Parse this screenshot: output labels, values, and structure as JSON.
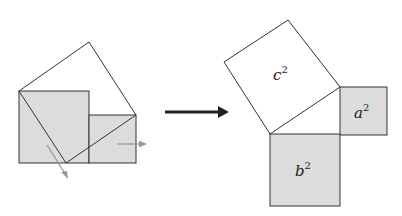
{
  "diagram": {
    "type": "pythagorean-proof-rearrangement",
    "colors": {
      "shaded_fill": "#dcdcdc",
      "outline": "#333333",
      "motion_arrow": "#999999",
      "main_arrow": "#222222"
    },
    "left_figure": {
      "description": "Squares a^2 and b^2 placed side by side with tilted square c^2 overlaid; gray arrows show triangles sliding out",
      "arrows": [
        "down-left motion arrow",
        "right motion arrow"
      ]
    },
    "right_figure": {
      "labels": {
        "c": {
          "base": "c",
          "exp": "2"
        },
        "a": {
          "base": "a",
          "exp": "2"
        },
        "b": {
          "base": "b",
          "exp": "2"
        }
      }
    },
    "transition_arrow": "right-arrow"
  }
}
